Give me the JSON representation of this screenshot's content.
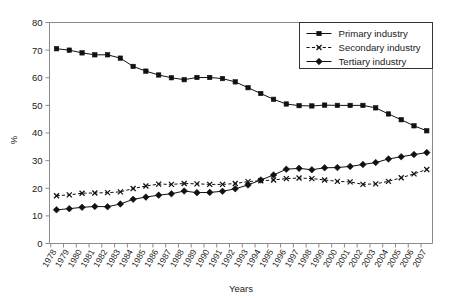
{
  "chart_data": {
    "type": "line",
    "title": "",
    "xlabel": "Years",
    "ylabel": "%",
    "ylim": [
      0,
      80
    ],
    "ytick_step": 10,
    "grid": false,
    "legend_position": "top-right",
    "categories": [
      "1978",
      "1979",
      "1980",
      "1981",
      "1982",
      "1983",
      "1984",
      "1985",
      "1986",
      "1987",
      "1988",
      "1989",
      "1990",
      "1991",
      "1992",
      "1993",
      "1994",
      "1995",
      "1996",
      "1997",
      "1998",
      "1999",
      "2000",
      "2001",
      "2002",
      "2003",
      "2004",
      "2005",
      "2006",
      "2007"
    ],
    "yticks": [
      "0",
      "10",
      "20",
      "30",
      "40",
      "50",
      "60",
      "70",
      "80"
    ],
    "series": [
      {
        "name": "Primary industry",
        "marker": "square",
        "line_style": "solid",
        "color": "#111111",
        "values": [
          70.5,
          70.0,
          69.0,
          68.3,
          68.3,
          67.1,
          64.1,
          62.4,
          61.0,
          60.0,
          59.3,
          60.1,
          60.1,
          59.7,
          58.5,
          56.4,
          54.3,
          52.2,
          50.5,
          49.9,
          49.8,
          50.1,
          50.0,
          50.0,
          50.0,
          49.1,
          46.9,
          44.8,
          42.6,
          40.8
        ]
      },
      {
        "name": "Secondary industry",
        "marker": "x",
        "line_style": "dashed",
        "color": "#111111",
        "values": [
          17.3,
          17.6,
          18.2,
          18.3,
          18.4,
          18.7,
          19.9,
          20.8,
          21.5,
          21.4,
          21.7,
          21.6,
          21.4,
          21.4,
          21.7,
          22.4,
          22.7,
          23.0,
          23.5,
          23.7,
          23.5,
          23.0,
          22.5,
          22.3,
          21.4,
          21.6,
          22.5,
          23.8,
          25.2,
          26.8
        ]
      },
      {
        "name": "Tertiary industry",
        "marker": "diamond",
        "line_style": "solid",
        "color": "#111111",
        "values": [
          12.2,
          12.6,
          13.1,
          13.4,
          13.3,
          14.3,
          16.0,
          16.8,
          17.5,
          18.0,
          19.0,
          18.4,
          18.5,
          18.9,
          19.8,
          21.2,
          23.0,
          24.8,
          26.9,
          27.2,
          26.7,
          27.4,
          27.5,
          27.9,
          28.6,
          29.3,
          30.6,
          31.4,
          32.2,
          32.9
        ]
      }
    ]
  },
  "legend": {
    "items": [
      {
        "label": "Primary industry"
      },
      {
        "label": "Secondary industry"
      },
      {
        "label": "Tertiary industry"
      }
    ]
  },
  "axes": {
    "x_title": "Years",
    "y_title": "%"
  }
}
